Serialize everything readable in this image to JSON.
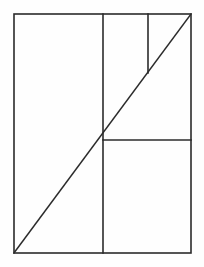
{
  "figure": {
    "background_color": "#fefefe",
    "stroke_color": "#2b2b2b",
    "stroke_width": 1.6,
    "canvas": {
      "width": 204,
      "height": 267
    },
    "outer_rectangle": {
      "name": "outer-rectangle",
      "x": 14,
      "y": 14,
      "width": 177,
      "height": 239,
      "left": 14,
      "top": 14,
      "right": 191,
      "bottom": 253
    },
    "segments": [
      {
        "name": "main-diagonal",
        "label": "Diagonal from bottom-left corner to top-right corner",
        "x1": 14,
        "y1": 253,
        "x2": 191,
        "y2": 14
      },
      {
        "name": "full-height-vertical",
        "label": "Vertical divider spanning full height",
        "x1": 103,
        "y1": 14,
        "x2": 103,
        "y2": 253
      },
      {
        "name": "short-vertical",
        "label": "Short vertical from top edge down to diagonal",
        "x1": 148,
        "y1": 14,
        "x2": 148,
        "y2": 73
      },
      {
        "name": "mid-horizontal",
        "label": "Horizontal from diagonal crossing to right edge",
        "x1": 103,
        "y1": 140,
        "x2": 191,
        "y2": 140
      }
    ],
    "intersections": [
      {
        "name": "diagonal-vertical-crossing",
        "x": 103,
        "y": 140
      },
      {
        "name": "diagonal-short-vertical-meet",
        "x": 148,
        "y": 73
      }
    ]
  }
}
